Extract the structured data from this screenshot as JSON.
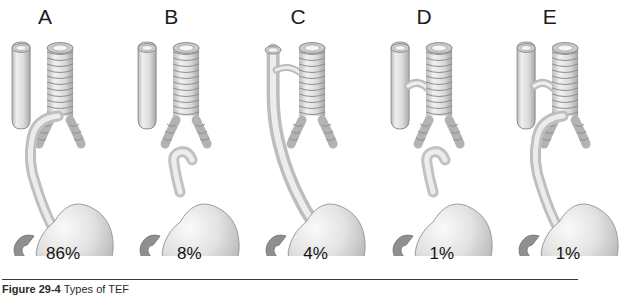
{
  "figure": {
    "panel_labels": [
      "A",
      "B",
      "C",
      "D",
      "E"
    ],
    "percentages": [
      "86%",
      "8%",
      "4%",
      "1%",
      "1%"
    ],
    "caption_label": "Figure 29-4",
    "caption_text": "Types of TEF",
    "colors": {
      "background": "#ffffff",
      "tissue_light": "#f2f2f2",
      "tissue_mid": "#d4d4d4",
      "tissue_dark": "#9a9a9a",
      "outline": "#8a8a8a",
      "duodenum": "#8f8f8f",
      "rule": "#3a3a3a",
      "text": "#1c1c1c"
    },
    "panels": [
      {
        "label": "A",
        "percentage": "86%",
        "esophagus_upper": "blind-pouch",
        "esophagus_lower": "fistula-to-distal-trachea",
        "icon": "esophageal-atresia-distal-fistula"
      },
      {
        "label": "B",
        "percentage": "8%",
        "esophagus_upper": "blind-pouch",
        "esophagus_lower": "blind-pouch",
        "icon": "pure-esophageal-atresia"
      },
      {
        "label": "C",
        "percentage": "4%",
        "esophagus_upper": "continuous",
        "esophagus_lower": "continuous",
        "icon": "h-type-fistula"
      },
      {
        "label": "D",
        "percentage": "1%",
        "esophagus_upper": "fistula-to-trachea",
        "esophagus_lower": "blind-pouch",
        "icon": "proximal-fistula-atresia"
      },
      {
        "label": "E",
        "percentage": "1%",
        "esophagus_upper": "fistula-to-trachea",
        "esophagus_lower": "fistula-to-distal-trachea",
        "icon": "double-fistula-atresia"
      }
    ]
  }
}
